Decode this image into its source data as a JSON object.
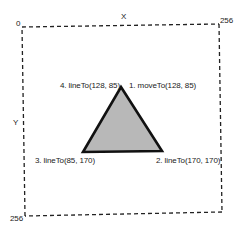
{
  "diagram": {
    "axes": {
      "x_label": "X",
      "y_label": "Y",
      "origin_label": "0",
      "x_max_label": "256",
      "y_max_label": "256"
    },
    "canvas_box": {
      "style": "dashed",
      "color": "#222222"
    },
    "triangle": {
      "fill": "#b8b8b8",
      "stroke": "#111111",
      "vertices": [
        {
          "step": "1. moveTo(128, 85)",
          "x": 128,
          "y": 85
        },
        {
          "step": "2. lineTo(170, 170)",
          "x": 170,
          "y": 170
        },
        {
          "step": "3. lineTo(85, 170)",
          "x": 85,
          "y": 170
        },
        {
          "step": "4. lineTo(128, 85)",
          "x": 128,
          "y": 85
        }
      ]
    },
    "labels": {
      "step1": "1. moveTo(128, 85)",
      "step2": "2. lineTo(170, 170)",
      "step3": "3. lineTo(85, 170)",
      "step4": "4. lineTo(128, 85)"
    }
  }
}
